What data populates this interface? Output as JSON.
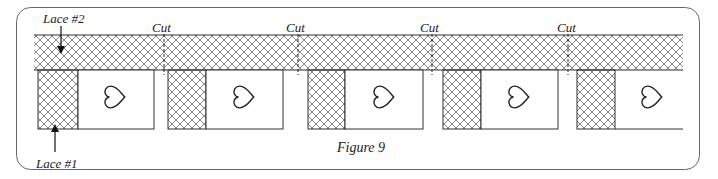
{
  "figure": {
    "caption": "Figure 9",
    "labels": {
      "lace2": "Lace #2",
      "lace1": "Lace #1",
      "cut": "Cut"
    },
    "cuts": [
      {
        "label": "Cut",
        "x": 164
      },
      {
        "label": "Cut",
        "x": 298
      },
      {
        "label": "Cut",
        "x": 432
      },
      {
        "label": "Cut",
        "x": 568
      }
    ],
    "blocks": [
      {
        "lace_x": 38,
        "lace_w": 40,
        "square_x": 78,
        "square_w": 76
      },
      {
        "lace_x": 168,
        "lace_w": 38,
        "square_x": 206,
        "square_w": 77
      },
      {
        "lace_x": 308,
        "lace_w": 37,
        "square_x": 345,
        "square_w": 78
      },
      {
        "lace_x": 443,
        "lace_w": 38,
        "square_x": 481,
        "square_w": 77
      },
      {
        "lace_x": 577,
        "lace_w": 38,
        "square_x": 615,
        "square_w": 68,
        "open_right": true
      }
    ],
    "colors": {
      "line": "#333333",
      "hatch": "#555555",
      "frame": "#666666"
    }
  }
}
